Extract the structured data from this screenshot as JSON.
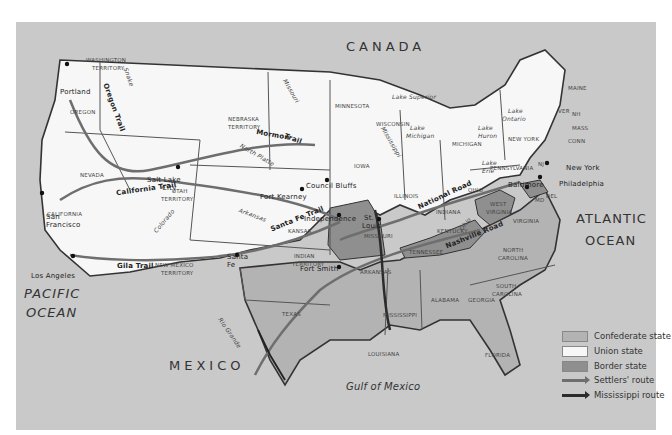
{
  "map": {
    "title_regions": {
      "canada": "CANADA",
      "mexico": "MEXICO",
      "pacific_1": "PACIFIC",
      "pacific_2": "OCEAN",
      "atlantic_1": "ATLANTIC",
      "atlantic_2": "OCEAN",
      "gulf": "Gulf of Mexico"
    },
    "states": {
      "washington": "WASHINGTON",
      "washington2": "TERRITORY",
      "oregon": "OREGON",
      "nevada": "NEVADA",
      "california": "CALIFORNIA",
      "utah": "UTAH",
      "utah2": "TERRITORY",
      "nebraska": "NEBRASKA",
      "nebraska2": "TERRITORY",
      "newmexico": "NEW MEXICO",
      "newmexico2": "TERRITORY",
      "kansas": "KANSAS",
      "indian": "INDIAN",
      "indian2": "TERRITORY",
      "texas": "TEXAS",
      "minnesota": "MINNESOTA",
      "iowa": "IOWA",
      "missouri": "MISSOURI",
      "arkansas": "ARKANSAS",
      "louisiana": "LOUISIANA",
      "wisconsin": "WISCONSIN",
      "illinois": "ILLINOIS",
      "michigan": "MICHIGAN",
      "indiana": "INDIANA",
      "ohio": "OHIO",
      "kentucky": "KENTUCKY",
      "tennessee": "TENNESSEE",
      "mississippi": "MISSISSIPPI",
      "alabama": "ALABAMA",
      "georgia": "GEORGIA",
      "florida": "FLORIDA",
      "southcarolina": "SOUTH",
      "southcarolina2": "CAROLINA",
      "northcarolina": "NORTH",
      "northcarolina2": "CAROLINA",
      "virginia": "VIRGINIA",
      "westvirginia": "WEST",
      "westvirginia2": "VIRGINIA",
      "pennsylvania": "PENNSYLVANIA",
      "newyork": "NEW YORK",
      "maine": "MAINE",
      "vermont": "VER",
      "nh": "NH",
      "mass": "MASS",
      "conn": "CONN",
      "nj": "NJ",
      "del": "DEL",
      "md": "MD"
    },
    "cities": {
      "portland": "Portland",
      "saltlake": "Salt Lake",
      "saltlake2": "City",
      "sanfrancisco": "San",
      "sanfrancisco2": "Francisco",
      "losangeles": "Los Angeles",
      "santafe": "Santa",
      "santafe2": "Fe",
      "fortkearney": "Fort Kearney",
      "councilbluffs": "Council Bluffs",
      "independence": "Independence",
      "stlouis": "St.",
      "stlouis2": "Louis",
      "fortsmith": "Fort Smith",
      "baltimore": "Baltimore",
      "philadelphia": "Philadelphia",
      "newyork": "New York"
    },
    "trails": {
      "oregon": "Oregon Trail",
      "mormon": "Mormon",
      "mormon2": "Trail",
      "california": "California Trail",
      "santafe": "Santa Fe Trail",
      "gila": "Gila Trail",
      "national": "National Road",
      "nashville": "Nashville Road"
    },
    "water": {
      "snake": "Snake",
      "missouri": "Missouri",
      "northplatte": "North Platte",
      "colorado": "Colorado",
      "arkansas": "Arkansas",
      "riogrande": "Rio Grande",
      "mississippi": "Mississippi",
      "ohio": "Ohio",
      "superior": "Lake Superior",
      "michigan": "Lake",
      "michigan2": "Michigan",
      "huron": "Lake",
      "huron2": "Huron",
      "ontario": "Lake",
      "ontario2": "Ontario",
      "erie": "Lake",
      "erie2": "Erie"
    },
    "colors": {
      "sea_land_foreign": "#c9c9c9",
      "confederate": "#b3b3b3",
      "union": "#f7f7f7",
      "border": "#8f8f8f",
      "settlers_route": "#6e6e6e",
      "mississippi_route": "#2b2b2b",
      "boundary": "#333333"
    }
  },
  "legend": {
    "items": [
      {
        "label": "Confederate state",
        "kind": "swatch",
        "color": "#b3b3b3"
      },
      {
        "label": "Union state",
        "kind": "swatch",
        "color": "#f7f7f7"
      },
      {
        "label": "Border state",
        "kind": "swatch",
        "color": "#8f8f8f"
      },
      {
        "label": "Settlers' route",
        "kind": "arrow",
        "color": "#6e6e6e"
      },
      {
        "label": "Mississippi route",
        "kind": "arrow",
        "color": "#2b2b2b"
      }
    ]
  }
}
